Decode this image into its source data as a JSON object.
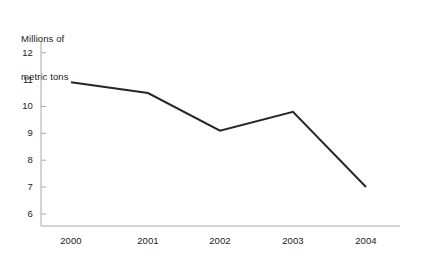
{
  "chart_data": {
    "type": "line",
    "title": "Millions of metric tons",
    "title_lines": [
      "Millions of",
      "metric tons"
    ],
    "xlabel": "",
    "ylabel": "Millions of metric tons",
    "categories": [
      "2000",
      "2001",
      "2002",
      "2003",
      "2004"
    ],
    "x": [
      2000,
      2001,
      2002,
      2003,
      2004
    ],
    "values": [
      10.9,
      10.5,
      9.1,
      9.8,
      7.0
    ],
    "series": [
      {
        "name": "Millions of metric tons",
        "values": [
          10.9,
          10.5,
          9.1,
          9.8,
          7.0
        ]
      }
    ],
    "ylim": [
      5.5,
      12.4
    ],
    "yticks": [
      12,
      11,
      10,
      9,
      8,
      7,
      6
    ],
    "ytick_labels": [
      "12",
      "11",
      "10",
      "9",
      "8",
      "7",
      "6"
    ],
    "xtick_labels": [
      "2000",
      "2001",
      "2002",
      "2003",
      "2004"
    ],
    "grid": false,
    "legend": false,
    "legend_position": "none",
    "colors": {
      "line": "#262626",
      "axis": "#a8a8a8",
      "text": "#1a1a1a",
      "background": "#ffffff"
    },
    "line_width": 2,
    "markers": false
  },
  "layout": {
    "plot_left": 41,
    "plot_right": 400,
    "plot_top": 42,
    "plot_bottom": 226,
    "y_top_value": 12.4,
    "y_bottom_value": 5.55,
    "x_positions": [
      71,
      148,
      220,
      293,
      366
    ],
    "tick_length": 5
  }
}
